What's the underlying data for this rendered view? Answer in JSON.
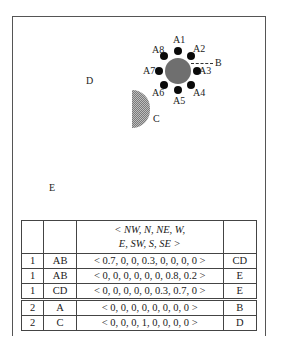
{
  "figure": {
    "labels": {
      "D": "D",
      "C": "C",
      "E": "E",
      "B": "B"
    },
    "satellites": [
      "A1",
      "A2",
      "A3",
      "A4",
      "A5",
      "A6",
      "A7",
      "A8"
    ],
    "colors": {
      "big_circle": "#6f6f6f",
      "satellite": "#0a0a0a",
      "frame": "#555555"
    }
  },
  "table": {
    "header": {
      "col1": "",
      "col2": "",
      "col3_line1": "< NW, N, NE, W,",
      "col3_line2": "E, SW, S, SE >",
      "col4": ""
    },
    "rows": [
      {
        "step": "1",
        "obj": "AB",
        "vector": "< 0.7, 0, 0, 0.3, 0, 0, 0, 0 >",
        "target": "CD",
        "group": 1
      },
      {
        "step": "1",
        "obj": "AB",
        "vector": "< 0, 0, 0, 0, 0, 0, 0.8, 0.2 >",
        "target": "E",
        "group": 1
      },
      {
        "step": "1",
        "obj": "CD",
        "vector": "< 0, 0, 0, 0, 0, 0.3, 0.7, 0 >",
        "target": "E",
        "group": 1
      },
      {
        "step": "2",
        "obj": "A",
        "vector": "< 0, 0, 0, 0, 0, 0, 0, 0 >",
        "target": "B",
        "group": 2
      },
      {
        "step": "2",
        "obj": "C",
        "vector": "< 0, 0, 0, 1, 0, 0, 0, 0 >",
        "target": "D",
        "group": 2
      }
    ]
  }
}
